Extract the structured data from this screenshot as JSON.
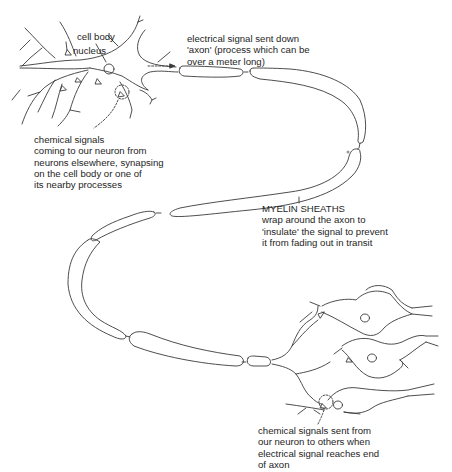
{
  "diagram": {
    "labels": {
      "cell_body": "cell body",
      "nucleus": "nucleus",
      "axon_signal": {
        "lines": [
          "electrical signal sent down",
          "'axon' (process which can be",
          "over a meter long)"
        ]
      },
      "incoming_signals": {
        "lines": [
          "chemical signals",
          "coming to our neuron from",
          "neurons elsewhere, synapsing",
          "on the cell body or one of",
          "its nearby processes"
        ]
      },
      "myelin": {
        "lines": [
          "MYELIN SHEATHS",
          "wrap around the axon to",
          "'insulate' the signal to prevent",
          "it from fading out in transit"
        ]
      },
      "outgoing_signals": {
        "lines": [
          "chemical signals sent from",
          "our neuron to others when",
          "electrical signal reaches end",
          "of axon"
        ]
      }
    },
    "colors": {
      "line": "#3a3a3a",
      "text": "#1e1e1e",
      "background": "#ffffff"
    }
  }
}
